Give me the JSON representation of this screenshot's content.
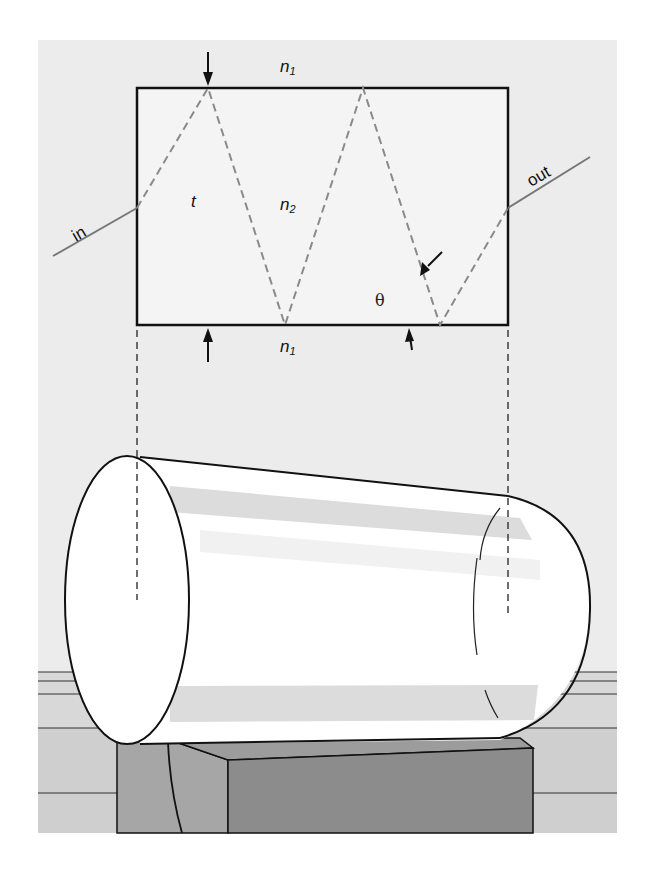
{
  "figure": {
    "type": "optical-fiber-total-internal-reflection",
    "colors": {
      "page": "#ffffff",
      "panel": "#ececec",
      "slab": "#f4f4f4",
      "ray": "#8a8a8a",
      "ink": "#111111",
      "cylinder_face": "#ffffff",
      "cylinder_band": "#dcdcdc",
      "shelf_light": "#d6d6d6",
      "shelf_mid": "#c8c8c8",
      "block_side": "#9a9a9a",
      "block_front": "#888888"
    },
    "labels": {
      "n1_top": "n",
      "n1_top_sub": "1",
      "n1_bottom": "n",
      "n1_bottom_sub": "1",
      "n2": "n",
      "n2_sub": "2",
      "thickness": "t",
      "angle": "θ",
      "input": "in",
      "output": "out"
    },
    "slab": {
      "x": 137,
      "y": 88,
      "width": 371,
      "height": 237
    },
    "ray_path": [
      [
        137,
        208
      ],
      [
        208,
        88
      ],
      [
        285,
        325
      ],
      [
        363,
        88
      ],
      [
        440,
        325
      ],
      [
        508,
        208
      ]
    ]
  }
}
